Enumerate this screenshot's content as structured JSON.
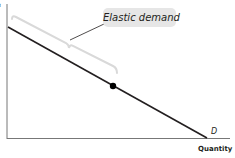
{
  "axes": {
    "y_label": "Price",
    "y_label_visible": "e",
    "x_label": "Quantity"
  },
  "curve": {
    "label": "D",
    "color": "#231f20"
  },
  "callout": {
    "text": "Elastic demand",
    "background": "#e6e6e6"
  },
  "bracket": {
    "color": "#d9d9d9"
  },
  "point": {
    "color": "#000000"
  }
}
